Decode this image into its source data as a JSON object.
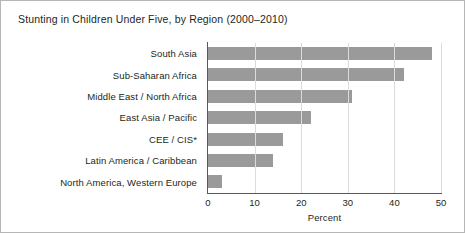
{
  "figure": {
    "title": "Stunting in Children Under Five, by Region (2000–2010)",
    "frame_color": "#b6b6b6",
    "background": "#ffffff"
  },
  "chart_data": {
    "type": "bar",
    "orientation": "horizontal",
    "title": "Stunting in Children Under Five, by Region (2000–2010)",
    "xlabel": "Percent",
    "ylabel": "",
    "categories": [
      "South Asia",
      "Sub-Saharan Africa",
      "Middle East / North Africa",
      "East Asia / Pacific",
      "CEE / CIS*",
      "Latin America / Caribbean",
      "North America, Western Europe"
    ],
    "values": [
      48,
      42,
      31,
      22,
      16,
      14,
      3
    ],
    "xlim": [
      0,
      50
    ],
    "xticks": [
      0,
      10,
      20,
      30,
      40,
      50
    ],
    "xtick_labels": [
      "0",
      "10",
      "20",
      "30",
      "40",
      "50"
    ],
    "grid": "vertical",
    "legend": null,
    "bar_color": "#9a9a9a",
    "gridline_color": "#dcdcdc",
    "axis_color": "#58595b"
  }
}
